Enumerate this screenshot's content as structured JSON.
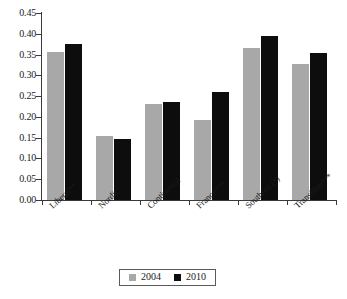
{
  "chart_data": {
    "type": "bar",
    "title": "",
    "subtitle": "",
    "xlabel": "",
    "ylabel": "",
    "ylim": [
      0.0,
      0.45
    ],
    "ytick_step": 0.05,
    "ytick_labels": [
      "0.45",
      "0.40",
      "0.35",
      "0.30",
      "0.25",
      "0.20",
      "0.15",
      "0.10",
      "0.05",
      "0.00"
    ],
    "ytick_values": [
      0.45,
      0.4,
      0.35,
      0.3,
      0.25,
      0.2,
      0.15,
      0.1,
      0.05,
      0.0
    ],
    "grid": false,
    "legend_position": "bottom",
    "categories": [
      "Liberal**",
      "Nordic",
      "Continental",
      "France***",
      "Southern (*)",
      "Transition***"
    ],
    "series": [
      {
        "name": "2004",
        "color": "#a8a8a8",
        "values": [
          0.356,
          0.155,
          0.23,
          0.192,
          0.367,
          0.328
        ]
      },
      {
        "name": "2010",
        "color": "#0d0d0d",
        "values": [
          0.375,
          0.148,
          0.235,
          0.259,
          0.395,
          0.354
        ]
      }
    ],
    "annotations": []
  },
  "legend": {
    "items": [
      {
        "label": "2004",
        "swatch": "gray-square-swatch"
      },
      {
        "label": "2010",
        "swatch": "black-square-swatch"
      }
    ]
  }
}
